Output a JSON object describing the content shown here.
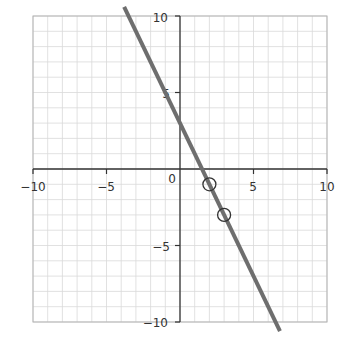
{
  "chart_data": {
    "type": "line",
    "title": "",
    "xlabel": "",
    "ylabel": "",
    "xlim": [
      -10,
      10
    ],
    "ylim": [
      -10,
      10
    ],
    "grid": true,
    "grid_step": 1,
    "x_ticks": [
      -10,
      -5,
      0,
      5,
      10
    ],
    "y_ticks": [
      -10,
      -5,
      5,
      10
    ],
    "x_tick_labels": [
      "−10",
      "−5",
      "0",
      "5",
      "10"
    ],
    "y_tick_labels": [
      "−10",
      "−5",
      "5",
      "10"
    ],
    "series": [
      {
        "name": "line",
        "equation": "y = -2x + 3",
        "slope": -2,
        "intercept": 3,
        "x": [
          -3.8,
          6.8
        ],
        "y": [
          10.6,
          -10.6
        ],
        "color": "#6e6e6e"
      }
    ],
    "marked_points": [
      {
        "x": 2,
        "y": -1
      },
      {
        "x": 3,
        "y": -3
      }
    ]
  },
  "colors": {
    "grid": "#d9d9d9",
    "axis": "#333333",
    "line": "#6e6e6e",
    "marker": "#333333",
    "border": "#b3b3b3"
  },
  "labels": {
    "origin": "0",
    "x_neg10": "−10",
    "x_neg5": "−5",
    "x_5": "5",
    "x_10": "10",
    "y_10": "10",
    "y_5": "5",
    "y_neg5": "−5",
    "y_neg10": "−10"
  }
}
